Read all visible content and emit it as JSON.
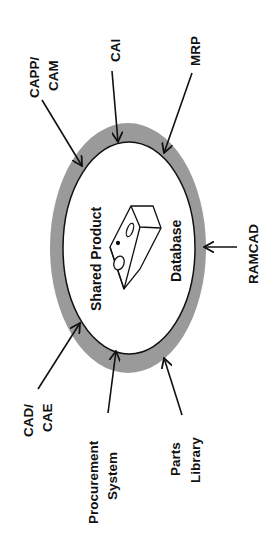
{
  "diagram": {
    "center": {
      "line1": "Shared Product",
      "line2": "Database",
      "icon": "database-box-icon"
    },
    "ring_color": "#9a9a9a",
    "systems": [
      {
        "id": "capp-cam",
        "line1": "CAPP/",
        "line2": "CAM"
      },
      {
        "id": "cai",
        "line1": "CAI",
        "line2": ""
      },
      {
        "id": "mrp",
        "line1": "MRP",
        "line2": ""
      },
      {
        "id": "ramcad",
        "line1": "RAMCAD",
        "line2": ""
      },
      {
        "id": "cad-cae",
        "line1": "CAD/",
        "line2": "CAE"
      },
      {
        "id": "procurement",
        "line1": "Procurement",
        "line2": "System"
      },
      {
        "id": "parts-library",
        "line1": "Parts",
        "line2": "Library"
      }
    ]
  }
}
